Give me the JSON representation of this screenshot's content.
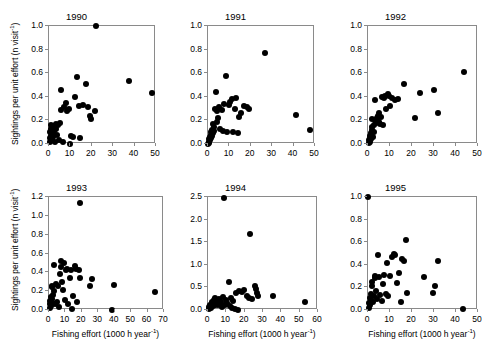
{
  "figure": {
    "axis_title_x": "Fishing effort (1000 h year",
    "axis_title_x_sup": "-1",
    "axis_title_x_tail": ")",
    "axis_title_y": "Sightings per unit effort (n visit",
    "axis_title_y_sup": "-1",
    "axis_title_y_tail": ")",
    "point_color": "#000000",
    "axis_color": "#8a8a8a",
    "background": "#ffffff"
  },
  "chart_data": [
    {
      "type": "scatter",
      "title": "1990",
      "xlabel": "Fishing effort (1000 h year-1)",
      "ylabel": "Sightings per unit effort (n visit-1)",
      "xlim": [
        0,
        50
      ],
      "ylim": [
        0.0,
        1.0
      ],
      "xticks": [
        0,
        10,
        20,
        30,
        40,
        50
      ],
      "yticks": [
        0.0,
        0.2,
        0.4,
        0.6,
        0.8,
        1.0
      ],
      "grid": false,
      "legend": "none",
      "points": [
        [
          0.3,
          0.02
        ],
        [
          0.5,
          0.05
        ],
        [
          0.6,
          0.1
        ],
        [
          0.8,
          0.13
        ],
        [
          1.0,
          0.07
        ],
        [
          1.1,
          0.16
        ],
        [
          1.3,
          0.04
        ],
        [
          1.5,
          0.12
        ],
        [
          1.7,
          0.09
        ],
        [
          1.9,
          0.15
        ],
        [
          2.1,
          0.06
        ],
        [
          2.3,
          0.11
        ],
        [
          2.6,
          0.14
        ],
        [
          2.9,
          0.02
        ],
        [
          3.2,
          0.17
        ],
        [
          3.5,
          0.13
        ],
        [
          3.8,
          0.08
        ],
        [
          4.2,
          0.16
        ],
        [
          4.6,
          0.03
        ],
        [
          5.0,
          0.18
        ],
        [
          5.4,
          0.29
        ],
        [
          5.8,
          0.46
        ],
        [
          6.4,
          0.02
        ],
        [
          7.2,
          0.31
        ],
        [
          8.0,
          0.35
        ],
        [
          8.6,
          0.28
        ],
        [
          9.3,
          0.3
        ],
        [
          10.0,
          0.0
        ],
        [
          10.4,
          0.07
        ],
        [
          11.2,
          0.06
        ],
        [
          12.2,
          0.4
        ],
        [
          13.1,
          0.57
        ],
        [
          13.8,
          0.32
        ],
        [
          14.6,
          0.05
        ],
        [
          16.0,
          0.33
        ],
        [
          17.4,
          0.51
        ],
        [
          18.2,
          0.31
        ],
        [
          19.0,
          0.24
        ],
        [
          19.8,
          0.21
        ],
        [
          21.6,
          0.28
        ],
        [
          21.9,
          1.0
        ],
        [
          37.4,
          0.53
        ],
        [
          48.2,
          0.43
        ]
      ]
    },
    {
      "type": "scatter",
      "title": "1991",
      "xlabel": "Fishing effort (1000 h year-1)",
      "ylabel": "Sightings per unit effort (n visit-1)",
      "xlim": [
        0,
        50
      ],
      "ylim": [
        0.0,
        1.0
      ],
      "xticks": [
        0,
        10,
        20,
        30,
        40,
        50
      ],
      "yticks": [
        0.0,
        0.2,
        0.4,
        0.6,
        0.8,
        1.0
      ],
      "grid": false,
      "legend": "none",
      "points": [
        [
          0.2,
          0.0
        ],
        [
          0.4,
          0.02
        ],
        [
          0.5,
          0.04
        ],
        [
          0.7,
          0.01
        ],
        [
          0.9,
          0.06
        ],
        [
          1.0,
          0.03
        ],
        [
          1.2,
          0.08
        ],
        [
          1.4,
          0.05
        ],
        [
          1.6,
          0.1
        ],
        [
          1.8,
          0.07
        ],
        [
          2.0,
          0.12
        ],
        [
          2.2,
          0.09
        ],
        [
          2.4,
          0.17
        ],
        [
          2.7,
          0.14
        ],
        [
          3.0,
          0.11
        ],
        [
          3.3,
          0.3
        ],
        [
          3.6,
          0.44
        ],
        [
          4.0,
          0.28
        ],
        [
          4.4,
          0.19
        ],
        [
          4.8,
          0.22
        ],
        [
          5.2,
          0.31
        ],
        [
          5.8,
          0.13
        ],
        [
          6.4,
          0.29
        ],
        [
          7.0,
          0.11
        ],
        [
          7.6,
          0.34
        ],
        [
          8.2,
          0.58
        ],
        [
          8.8,
          0.1
        ],
        [
          9.6,
          0.33
        ],
        [
          10.4,
          0.36
        ],
        [
          11.0,
          0.38
        ],
        [
          11.8,
          0.1
        ],
        [
          12.6,
          0.3
        ],
        [
          13.2,
          0.39
        ],
        [
          13.8,
          0.09
        ],
        [
          14.6,
          0.23
        ],
        [
          15.4,
          0.26
        ],
        [
          16.8,
          0.32
        ],
        [
          18.0,
          0.31
        ],
        [
          19.2,
          0.3
        ],
        [
          26.8,
          0.77
        ],
        [
          41.2,
          0.25
        ],
        [
          47.6,
          0.12
        ]
      ]
    },
    {
      "type": "scatter",
      "title": "1992",
      "xlabel": "Fishing effort (1000 h year-1)",
      "ylabel": "Sightings per unit effort (n visit-1)",
      "xlim": [
        0,
        50
      ],
      "ylim": [
        0.0,
        1.0
      ],
      "xticks": [
        0,
        10,
        20,
        30,
        40,
        50
      ],
      "yticks": [
        0.0,
        0.2,
        0.4,
        0.6,
        0.8,
        1.0
      ],
      "grid": false,
      "legend": "none",
      "points": [
        [
          0.3,
          0.01
        ],
        [
          0.5,
          0.03
        ],
        [
          0.7,
          0.05
        ],
        [
          0.9,
          0.02
        ],
        [
          1.1,
          0.07
        ],
        [
          1.3,
          0.09
        ],
        [
          1.5,
          0.04
        ],
        [
          1.6,
          0.12
        ],
        [
          1.8,
          0.21
        ],
        [
          2.0,
          0.14
        ],
        [
          2.2,
          0.06
        ],
        [
          2.5,
          0.16
        ],
        [
          2.8,
          0.1
        ],
        [
          3.1,
          0.37
        ],
        [
          3.4,
          0.2
        ],
        [
          3.6,
          0.18
        ],
        [
          4.0,
          0.22
        ],
        [
          4.4,
          0.24
        ],
        [
          4.8,
          0.26
        ],
        [
          5.2,
          0.19
        ],
        [
          5.6,
          0.17
        ],
        [
          6.0,
          0.23
        ],
        [
          6.4,
          0.4
        ],
        [
          6.8,
          0.16
        ],
        [
          7.2,
          0.39
        ],
        [
          7.8,
          0.41
        ],
        [
          8.4,
          0.3
        ],
        [
          9.0,
          0.42
        ],
        [
          9.6,
          0.41
        ],
        [
          10.2,
          0.32
        ],
        [
          11.0,
          0.39
        ],
        [
          12.4,
          0.37
        ],
        [
          13.6,
          0.38
        ],
        [
          16.2,
          0.51
        ],
        [
          21.4,
          0.22
        ],
        [
          23.6,
          0.43
        ],
        [
          29.8,
          0.46
        ],
        [
          31.6,
          0.26
        ],
        [
          43.8,
          0.61
        ]
      ]
    },
    {
      "type": "scatter",
      "title": "1993",
      "xlabel": "Fishing effort (1000 h year-1)",
      "ylabel": "Sightings per unit effort (n visit-1)",
      "xlim": [
        0,
        70
      ],
      "ylim": [
        0.0,
        1.2
      ],
      "xticks": [
        0,
        10,
        20,
        30,
        40,
        50,
        60,
        70
      ],
      "yticks": [
        0.0,
        0.2,
        0.4,
        0.6,
        0.8,
        1.0,
        1.2
      ],
      "grid": false,
      "legend": "none",
      "points": [
        [
          0.4,
          0.02
        ],
        [
          0.6,
          0.06
        ],
        [
          0.8,
          0.1
        ],
        [
          1.0,
          0.04
        ],
        [
          1.2,
          0.14
        ],
        [
          1.4,
          0.08
        ],
        [
          1.6,
          0.24
        ],
        [
          1.8,
          0.12
        ],
        [
          2.0,
          0.26
        ],
        [
          2.4,
          0.16
        ],
        [
          2.8,
          0.48
        ],
        [
          3.2,
          0.2
        ],
        [
          3.6,
          0.06
        ],
        [
          4.0,
          0.28
        ],
        [
          4.6,
          0.09
        ],
        [
          5.2,
          0.25
        ],
        [
          5.8,
          0.03
        ],
        [
          6.4,
          0.38
        ],
        [
          7.0,
          0.52
        ],
        [
          7.6,
          0.46
        ],
        [
          8.2,
          0.3
        ],
        [
          8.8,
          0.21
        ],
        [
          9.4,
          0.5
        ],
        [
          10.0,
          0.11
        ],
        [
          10.6,
          0.42
        ],
        [
          11.2,
          0.44
        ],
        [
          11.8,
          0.06
        ],
        [
          12.6,
          0.34
        ],
        [
          13.4,
          0.43
        ],
        [
          14.0,
          0.01
        ],
        [
          14.8,
          0.15
        ],
        [
          15.6,
          0.47
        ],
        [
          16.4,
          0.44
        ],
        [
          17.2,
          0.08
        ],
        [
          18.0,
          0.42
        ],
        [
          18.6,
          1.14
        ],
        [
          19.0,
          0.34
        ],
        [
          24.8,
          0.26
        ],
        [
          26.2,
          0.33
        ],
        [
          38.6,
          0.0
        ],
        [
          39.8,
          0.27
        ],
        [
          64.6,
          0.19
        ]
      ]
    },
    {
      "type": "scatter",
      "title": "1994",
      "xlabel": "Fishing effort (1000 h year-1)",
      "ylabel": "Sightings per unit effort (n visit-1)",
      "xlim": [
        0,
        60
      ],
      "ylim": [
        0.0,
        2.5
      ],
      "xticks": [
        0,
        10,
        20,
        30,
        40,
        50,
        60
      ],
      "yticks": [
        0.0,
        0.5,
        1.0,
        1.5,
        2.0,
        2.5
      ],
      "grid": false,
      "legend": "none",
      "points": [
        [
          0.4,
          0.02
        ],
        [
          0.8,
          0.06
        ],
        [
          1.2,
          0.1
        ],
        [
          1.6,
          0.04
        ],
        [
          2.0,
          0.14
        ],
        [
          2.4,
          0.18
        ],
        [
          2.8,
          0.08
        ],
        [
          3.2,
          0.22
        ],
        [
          3.6,
          0.12
        ],
        [
          4.0,
          0.26
        ],
        [
          4.4,
          0.16
        ],
        [
          4.8,
          0.2
        ],
        [
          5.2,
          0.1
        ],
        [
          5.8,
          0.24
        ],
        [
          6.4,
          0.14
        ],
        [
          7.0,
          0.18
        ],
        [
          7.6,
          0.06
        ],
        [
          8.2,
          0.28
        ],
        [
          8.8,
          2.48
        ],
        [
          9.4,
          0.12
        ],
        [
          10.0,
          0.22
        ],
        [
          10.6,
          0.16
        ],
        [
          11.2,
          0.62
        ],
        [
          11.8,
          0.09
        ],
        [
          12.4,
          0.26
        ],
        [
          13.0,
          0.04
        ],
        [
          13.8,
          0.2
        ],
        [
          14.6,
          0.02
        ],
        [
          15.4,
          0.38
        ],
        [
          16.2,
          0.01
        ],
        [
          17.0,
          0.42
        ],
        [
          18.4,
          0.4
        ],
        [
          19.6,
          0.44
        ],
        [
          21.0,
          0.3
        ],
        [
          22.4,
          0.26
        ],
        [
          22.8,
          1.68
        ],
        [
          24.2,
          0.24
        ],
        [
          25.4,
          0.52
        ],
        [
          26.2,
          0.46
        ],
        [
          26.8,
          0.38
        ],
        [
          27.4,
          0.3
        ],
        [
          35.6,
          0.31
        ],
        [
          52.8,
          0.18
        ]
      ]
    },
    {
      "type": "scatter",
      "title": "1995",
      "xlabel": "Fishing effort (1000 h year-1)",
      "ylabel": "Sightings per unit effort (n visit-1)",
      "xlim": [
        0,
        50
      ],
      "ylim": [
        0.0,
        1.0
      ],
      "xticks": [
        0,
        10,
        20,
        30,
        40,
        50
      ],
      "yticks": [
        0.0,
        0.2,
        0.4,
        0.6,
        0.8,
        1.0
      ],
      "grid": false,
      "legend": "none",
      "points": [
        [
          0.2,
          1.0
        ],
        [
          0.4,
          0.02
        ],
        [
          0.6,
          0.06
        ],
        [
          0.8,
          0.11
        ],
        [
          1.0,
          0.04
        ],
        [
          1.2,
          0.09
        ],
        [
          1.4,
          0.14
        ],
        [
          1.6,
          0.21
        ],
        [
          1.8,
          0.25
        ],
        [
          2.2,
          0.07
        ],
        [
          2.6,
          0.12
        ],
        [
          3.0,
          0.3
        ],
        [
          3.4,
          0.28
        ],
        [
          3.8,
          0.17
        ],
        [
          4.2,
          0.1
        ],
        [
          4.6,
          0.49
        ],
        [
          5.0,
          0.29
        ],
        [
          5.6,
          0.13
        ],
        [
          6.2,
          0.08
        ],
        [
          6.8,
          0.23
        ],
        [
          7.4,
          0.31
        ],
        [
          8.0,
          0.14
        ],
        [
          8.6,
          0.42
        ],
        [
          9.2,
          0.12
        ],
        [
          10.0,
          0.3
        ],
        [
          10.8,
          0.47
        ],
        [
          11.6,
          0.5
        ],
        [
          12.4,
          0.49
        ],
        [
          13.2,
          0.24
        ],
        [
          14.0,
          0.33
        ],
        [
          14.8,
          0.07
        ],
        [
          15.6,
          0.45
        ],
        [
          16.4,
          0.43
        ],
        [
          17.2,
          0.62
        ],
        [
          17.8,
          0.15
        ],
        [
          25.6,
          0.29
        ],
        [
          29.6,
          0.15
        ],
        [
          30.4,
          0.21
        ],
        [
          31.8,
          0.43
        ],
        [
          43.0,
          0.01
        ]
      ]
    }
  ]
}
